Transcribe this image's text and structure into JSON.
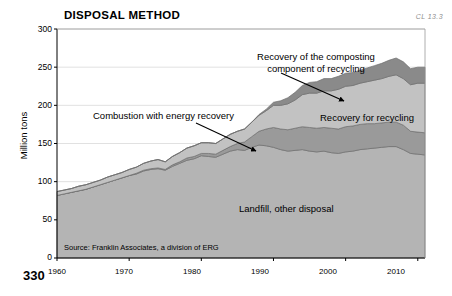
{
  "figure": {
    "title": "DISPOSAL METHOD",
    "corner_code": "CL 13.3",
    "page_number": "330",
    "source_note": "Source: Franklin Associates, a division of ERG",
    "annotations": {
      "composting_line1": "Recovery of the composting",
      "composting_line2": "component of recycling",
      "combustion": "Combustion with energy recovery",
      "recycling": "Recovery for recycling",
      "landfill": "Landfill, other disposal"
    },
    "colors": {
      "landfill": "#b4b4b4",
      "combustion": "#9a9a9a",
      "recycling": "#c2c2c2",
      "composting": "#8a8a8a",
      "axis": "#000000",
      "grid": "#d9d9d9",
      "plot_background": "#ffffff"
    }
  },
  "chart_data": {
    "type": "area",
    "title": "DISPOSAL METHOD",
    "xlabel": "",
    "ylabel": "Million tons",
    "xlim": [
      1960,
      2011
    ],
    "ylim": [
      0,
      300
    ],
    "yticks": [
      0,
      50,
      100,
      150,
      200,
      250,
      300
    ],
    "xticks": [
      1960,
      1970,
      1980,
      1990,
      2000,
      2010
    ],
    "grid": true,
    "legend": "annotations-inline",
    "stacked": true,
    "x": [
      1960,
      1961,
      1962,
      1963,
      1964,
      1965,
      1966,
      1967,
      1968,
      1969,
      1970,
      1971,
      1972,
      1973,
      1974,
      1975,
      1976,
      1977,
      1978,
      1979,
      1980,
      1981,
      1982,
      1983,
      1984,
      1985,
      1986,
      1987,
      1988,
      1989,
      1990,
      1991,
      1992,
      1993,
      1994,
      1995,
      1996,
      1997,
      1998,
      1999,
      2000,
      2001,
      2002,
      2003,
      2004,
      2005,
      2006,
      2007,
      2008,
      2009,
      2010,
      2011
    ],
    "series": [
      {
        "name": "Landfill, other disposal",
        "color": "#b4b4b4",
        "values": [
          82,
          84,
          86,
          88,
          90,
          93,
          96,
          99,
          102,
          105,
          108,
          110,
          114,
          116,
          117,
          115,
          120,
          124,
          128,
          130,
          134,
          133,
          132,
          136,
          140,
          142,
          141,
          145,
          148,
          147,
          145,
          142,
          140,
          141,
          142,
          140,
          139,
          140,
          138,
          137,
          139,
          140,
          142,
          143,
          144,
          145,
          146,
          146,
          142,
          137,
          136,
          135
        ]
      },
      {
        "name": "Combustion with energy recovery",
        "color": "#9a9a9a",
        "values": [
          0,
          0,
          0,
          0,
          0,
          0,
          0,
          0,
          0,
          0,
          0,
          1,
          1,
          1,
          1,
          1,
          2,
          2,
          3,
          3,
          3,
          4,
          4,
          5,
          6,
          8,
          11,
          14,
          18,
          22,
          26,
          27,
          28,
          29,
          30,
          31,
          31,
          31,
          32,
          32,
          33,
          33,
          33,
          33,
          32,
          32,
          32,
          32,
          32,
          29,
          29,
          29
        ]
      },
      {
        "name": "Recovery for recycling",
        "color": "#c2c2c2",
        "values": [
          5,
          5,
          5,
          6,
          6,
          6,
          6,
          7,
          7,
          7,
          8,
          8,
          9,
          10,
          11,
          10,
          11,
          12,
          13,
          14,
          14,
          14,
          14,
          15,
          16,
          16,
          17,
          19,
          21,
          24,
          29,
          31,
          34,
          37,
          42,
          45,
          46,
          48,
          49,
          52,
          53,
          53,
          54,
          55,
          57,
          58,
          60,
          62,
          61,
          61,
          64,
          65
        ]
      },
      {
        "name": "Recovery of the composting component of recycling",
        "color": "#8a8a8a",
        "values": [
          0,
          0,
          0,
          0,
          0,
          0,
          0,
          0,
          0,
          0,
          0,
          0,
          0,
          0,
          0,
          0,
          0,
          0,
          0,
          0,
          0,
          0,
          0,
          0,
          0,
          0,
          0,
          0,
          1,
          2,
          4,
          6,
          8,
          10,
          12,
          14,
          15,
          16,
          16,
          17,
          17,
          17,
          17,
          18,
          19,
          20,
          21,
          22,
          22,
          21,
          21,
          21
        ]
      }
    ]
  }
}
